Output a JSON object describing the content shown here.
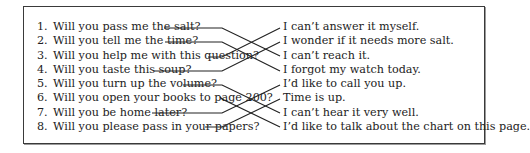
{
  "exercise": {
    "questions": [
      {
        "num": "1.",
        "text": "Will you pass me the salt?"
      },
      {
        "num": "2.",
        "text": "Will you tell me the time?"
      },
      {
        "num": "3.",
        "text": "Will you help me with this question?"
      },
      {
        "num": "4.",
        "text": "Will you taste this soup?"
      },
      {
        "num": "5.",
        "text": "Will you turn up the volume?"
      },
      {
        "num": "6.",
        "text": "Will you open your books to page 200?"
      },
      {
        "num": "7.",
        "text": "Will you be home later?"
      },
      {
        "num": "8.",
        "text": "Will you please pass in your papers?"
      }
    ],
    "answers": [
      "I can’t answer it myself.",
      "I wonder if it needs more salt.",
      "I can’t reach it.",
      "I forgot my watch today.",
      "I’d like to call you up.",
      "Time is up.",
      "I can’t hear it very well.",
      "I’d like to talk about the chart on this page."
    ],
    "matches": [
      {
        "question": 1,
        "answer": 3
      },
      {
        "question": 2,
        "answer": 4
      },
      {
        "question": 3,
        "answer": 1
      },
      {
        "question": 4,
        "answer": 2
      },
      {
        "question": 5,
        "answer": 7
      },
      {
        "question": 6,
        "answer": 8
      },
      {
        "question": 7,
        "answer": 5
      },
      {
        "question": 8,
        "answer": 6
      }
    ],
    "colors": {
      "ink": "#222222",
      "border": "#3a3a3a"
    }
  }
}
